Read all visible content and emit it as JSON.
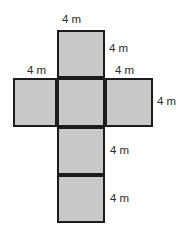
{
  "diagram": {
    "kind": "cube-net",
    "colors": {
      "face_fill": "#c8c8c8",
      "face_stroke": "#1c1c1c",
      "label_text": "#2b2b2b",
      "background": "#ffffff"
    },
    "faces": [
      {
        "name": "top-face",
        "position": "top"
      },
      {
        "name": "middle-left-face",
        "position": "middle-left"
      },
      {
        "name": "middle-center-face",
        "position": "middle-center"
      },
      {
        "name": "middle-right-face",
        "position": "middle-right"
      },
      {
        "name": "lower-upper-face",
        "position": "lower-upper"
      },
      {
        "name": "lower-bottom-face",
        "position": "lower-bottom"
      }
    ],
    "labels": {
      "top": "4 m",
      "top_right": "4 m",
      "middle_left": "4 m",
      "middle_right": "4 m",
      "far_right": "4 m",
      "lower_right": "4 m",
      "bottom_right": "4 m"
    }
  }
}
